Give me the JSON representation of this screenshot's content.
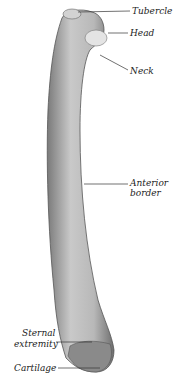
{
  "figure": {
    "labels": [
      {
        "id": "tubercle",
        "text": "Tubercle"
      },
      {
        "id": "head",
        "text": "Head"
      },
      {
        "id": "neck",
        "text": "Neck"
      },
      {
        "id": "anterior_border_1",
        "text": "Anterior"
      },
      {
        "id": "anterior_border_2",
        "text": "border"
      },
      {
        "id": "sternal_1",
        "text": "Sternal"
      },
      {
        "id": "sternal_2",
        "text": "extremity"
      },
      {
        "id": "cartilage",
        "text": "Cartilage"
      }
    ],
    "colors": {
      "bone_light": "#d8d8d8",
      "bone_dark": "#6a6a6a",
      "line": "#333333",
      "background": "#ffffff"
    }
  }
}
